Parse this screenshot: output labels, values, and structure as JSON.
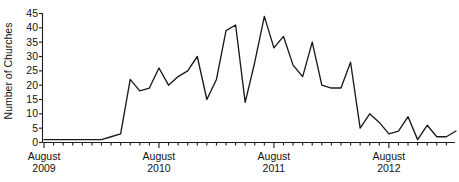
{
  "chart_data": {
    "type": "line",
    "title": "",
    "xlabel": "",
    "ylabel": "Number of Churches",
    "ylim": [
      0,
      45
    ],
    "ytick_values": [
      0,
      5,
      10,
      15,
      20,
      25,
      30,
      35,
      40,
      45
    ],
    "ytick_labels": [
      "0",
      "5",
      "10",
      "15",
      "20",
      "25",
      "30",
      "35",
      "40",
      "45"
    ],
    "grid": false,
    "legend": "none",
    "line_color": "#1a1a1a",
    "axis_color": "#1a1a1a",
    "x_major_labels": [
      {
        "month": "August",
        "year": "2009",
        "index": 0
      },
      {
        "month": "August",
        "year": "2010",
        "index": 12
      },
      {
        "month": "August",
        "year": "2011",
        "index": 24
      },
      {
        "month": "August",
        "year": "2012",
        "index": 36
      }
    ],
    "x_minor_tick_count": 44,
    "x_index_range": [
      0,
      43
    ],
    "values": [
      1,
      1,
      1,
      1,
      1,
      1,
      1,
      2,
      3,
      22,
      18,
      19,
      26,
      20,
      23,
      25,
      30,
      15,
      22,
      39,
      41,
      14,
      28,
      44,
      33,
      37,
      27,
      23,
      35,
      20,
      19,
      19,
      28,
      5,
      10,
      7,
      3,
      4,
      9,
      1,
      6,
      2,
      2,
      4
    ],
    "peak_value": 44,
    "min_value": 1
  }
}
